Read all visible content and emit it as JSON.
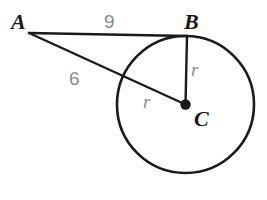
{
  "figure": {
    "kind": "circle-tangent-geometry-diagram",
    "background_color": "#ffffff",
    "stroke_color": "#1a1a1a",
    "label_color": "#1a1a1a",
    "measure_color": "#8a8a8a",
    "width": 267,
    "height": 200
  },
  "circle": {
    "name": "circle-c",
    "center_x": 185.5,
    "center_y": 104.5,
    "radius": 68.5,
    "stroke_width": 2.6
  },
  "points": {
    "a": {
      "label": "A",
      "x": 29,
      "y": 33,
      "label_x": 11,
      "label_y": 29
    },
    "b": {
      "label": "B",
      "x": 187,
      "y": 36,
      "label_x": 184,
      "label_y": 29
    },
    "c": {
      "label": "C",
      "x": 185.5,
      "y": 104.5,
      "label_x": 194,
      "label_y": 126,
      "dot_radius": 5.2
    }
  },
  "segments": [
    {
      "name": "segment-ab",
      "from": "a",
      "to": "b",
      "stroke_width": 2.4
    },
    {
      "name": "segment-ac",
      "from": "a",
      "to": "c",
      "stroke_width": 2.4
    },
    {
      "name": "segment-bc-radius",
      "from": "b",
      "to": "c",
      "stroke_width": 2.4
    }
  ],
  "labels": {
    "ab_length": {
      "text": "9",
      "x": 104,
      "y": 28
    },
    "ac_length": {
      "text": "6",
      "x": 69,
      "y": 85
    },
    "radius_bc": {
      "text": "r",
      "x": 191,
      "y": 76
    },
    "radius_ac": {
      "text": "r",
      "x": 143,
      "y": 108
    }
  }
}
